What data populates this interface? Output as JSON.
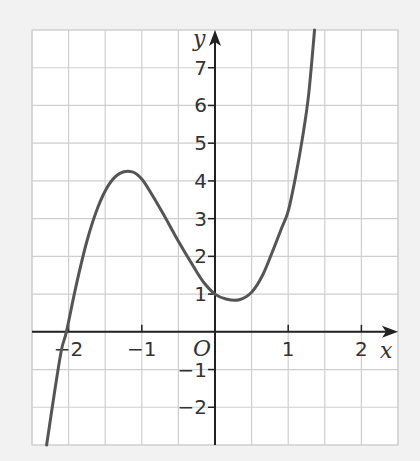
{
  "chart_data": {
    "type": "line",
    "title": "",
    "xlabel": "x",
    "ylabel": "y",
    "origin_label": "O",
    "xlim": [
      -2.5,
      2.5
    ],
    "ylim": [
      -3,
      8
    ],
    "grid": true,
    "grid_x_step": 0.5,
    "grid_y_step": 1,
    "x_ticks": [
      {
        "value": -2,
        "label": "−2"
      },
      {
        "value": -1,
        "label": "−1"
      },
      {
        "value": 1,
        "label": "1"
      },
      {
        "value": 2,
        "label": "2"
      }
    ],
    "y_ticks": [
      {
        "value": -2,
        "label": "−2"
      },
      {
        "value": -1,
        "label": "−1"
      },
      {
        "value": 1,
        "label": "1"
      },
      {
        "value": 2,
        "label": "2"
      },
      {
        "value": 3,
        "label": "3"
      },
      {
        "value": 4,
        "label": "4"
      },
      {
        "value": 5,
        "label": "5"
      },
      {
        "value": 6,
        "label": "6"
      },
      {
        "value": 7,
        "label": "7"
      }
    ],
    "series": [
      {
        "name": "curve",
        "color": "#555555",
        "points": [
          [
            -2.3,
            -3.0
          ],
          [
            -2.2,
            -1.7
          ],
          [
            -2.1,
            -0.5
          ],
          [
            -2.03,
            0.0
          ],
          [
            -1.9,
            1.2
          ],
          [
            -1.75,
            2.4
          ],
          [
            -1.6,
            3.3
          ],
          [
            -1.45,
            3.9
          ],
          [
            -1.3,
            4.2
          ],
          [
            -1.13,
            4.24
          ],
          [
            -1.0,
            4.05
          ],
          [
            -0.85,
            3.6
          ],
          [
            -0.7,
            3.1
          ],
          [
            -0.5,
            2.4
          ],
          [
            -0.3,
            1.75
          ],
          [
            -0.15,
            1.3
          ],
          [
            0.0,
            1.0
          ],
          [
            0.15,
            0.87
          ],
          [
            0.33,
            0.85
          ],
          [
            0.5,
            1.05
          ],
          [
            0.65,
            1.5
          ],
          [
            0.8,
            2.2
          ],
          [
            0.9,
            2.7
          ],
          [
            1.0,
            3.2
          ],
          [
            1.1,
            4.1
          ],
          [
            1.2,
            5.2
          ],
          [
            1.28,
            6.3
          ],
          [
            1.36,
            8.0
          ]
        ]
      }
    ]
  },
  "colors": {
    "background": "#f2f2f2",
    "plot_area": "#ffffff",
    "grid": "#cfcfcf",
    "axis": "#222222",
    "curve": "#555555"
  }
}
